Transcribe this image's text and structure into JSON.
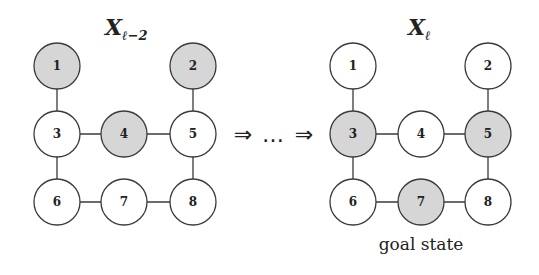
{
  "colors": {
    "filled": "#d6d6d6",
    "empty": "#ffffff",
    "stroke": "#3a3a3a"
  },
  "left_graph": {
    "title_main": "X",
    "title_sub": "ℓ−2",
    "nodes": [
      {
        "id": "1",
        "x": 57,
        "y": 66,
        "filled": true
      },
      {
        "id": "2",
        "x": 193,
        "y": 66,
        "filled": true
      },
      {
        "id": "3",
        "x": 57,
        "y": 134,
        "filled": false
      },
      {
        "id": "4",
        "x": 124,
        "y": 134,
        "filled": true
      },
      {
        "id": "5",
        "x": 193,
        "y": 134,
        "filled": false
      },
      {
        "id": "6",
        "x": 57,
        "y": 202,
        "filled": false
      },
      {
        "id": "7",
        "x": 124,
        "y": 202,
        "filled": false
      },
      {
        "id": "8",
        "x": 193,
        "y": 202,
        "filled": false
      }
    ]
  },
  "right_graph": {
    "title_main": "X",
    "title_sub": "ℓ",
    "caption": "goal state",
    "nodes": [
      {
        "id": "1",
        "x": 353,
        "y": 66,
        "filled": false
      },
      {
        "id": "2",
        "x": 488,
        "y": 66,
        "filled": false
      },
      {
        "id": "3",
        "x": 353,
        "y": 134,
        "filled": true
      },
      {
        "id": "4",
        "x": 421,
        "y": 134,
        "filled": false
      },
      {
        "id": "5",
        "x": 488,
        "y": 134,
        "filled": true
      },
      {
        "id": "6",
        "x": 353,
        "y": 202,
        "filled": false
      },
      {
        "id": "7",
        "x": 421,
        "y": 202,
        "filled": true
      },
      {
        "id": "8",
        "x": 488,
        "y": 202,
        "filled": false
      }
    ]
  },
  "edges": [
    [
      "1",
      "3"
    ],
    [
      "2",
      "5"
    ],
    [
      "3",
      "4"
    ],
    [
      "4",
      "5"
    ],
    [
      "3",
      "6"
    ],
    [
      "5",
      "8"
    ],
    [
      "6",
      "7"
    ],
    [
      "7",
      "8"
    ]
  ],
  "transition": {
    "arrow1": "⇒",
    "ellipsis": "…",
    "arrow2": "⇒"
  }
}
